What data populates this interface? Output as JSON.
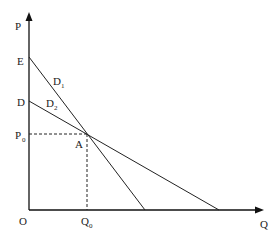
{
  "diagram": {
    "axes": {
      "y_label": "P",
      "x_label": "Q",
      "origin_label": "O"
    },
    "points": {
      "E": {
        "label": "E"
      },
      "D": {
        "label": "D"
      },
      "P0": {
        "label": "P",
        "sub": "0"
      },
      "Q0": {
        "label": "Q",
        "sub": "0"
      },
      "A": {
        "label": "A"
      }
    },
    "curves": [
      {
        "label": "D",
        "sub": "1",
        "description": "steeper demand curve from E"
      },
      {
        "label": "D",
        "sub": "2",
        "description": "flatter demand curve from D"
      }
    ]
  }
}
